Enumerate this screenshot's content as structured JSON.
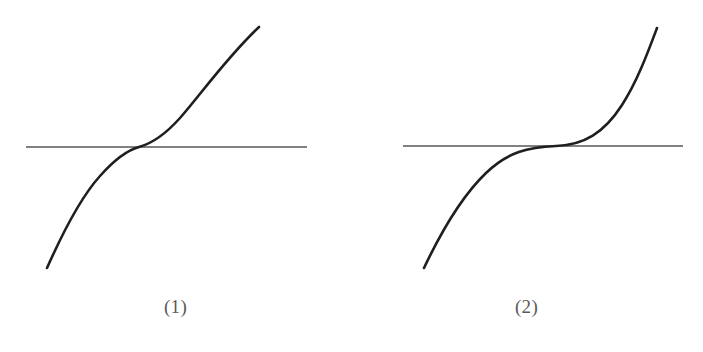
{
  "figure": {
    "background_color": "#ffffff",
    "curve_color": "#1f1f1f",
    "axis_line_color": "#575757",
    "caption_color": "#5a5a5a",
    "panels": [
      {
        "caption": "(1)",
        "curve_name": "cubic-increasing-curve",
        "axis_name": "horizontal-axis-line",
        "curve_path": "M 47 268 C 63 232 80 198 100 176 C 116 158 128 150 139 147 C 150 144 163 137 180 118 C 201 94 228 56 259 27",
        "axis_path": "M 26 147 L 307 147",
        "crossing_x": 139,
        "crossing_y": 147,
        "axis_y": 147,
        "axis_x_start": 26,
        "axis_x_end": 307,
        "curve_start": [
          47,
          268
        ],
        "curve_end": [
          259,
          27
        ]
      },
      {
        "caption": "(2)",
        "curve_name": "quintic-increasing-curve",
        "axis_name": "horizontal-axis-line",
        "curve_path": "M 424 268 C 442 230 462 196 486 173 C 508 152 528 147 556 146 C 584 145 604 133 622 105 C 637 82 648 52 657 28",
        "axis_path": "M 403 146 L 683 146",
        "crossing_x": 556,
        "crossing_y": 146,
        "axis_y": 146,
        "axis_x_start": 403,
        "axis_x_end": 683,
        "curve_start": [
          424,
          268
        ],
        "curve_end": [
          657,
          28
        ]
      }
    ]
  },
  "chart_data": {
    "type": "line",
    "title": "",
    "subtitle": "",
    "xlabel": "",
    "ylabel": "",
    "grid": false,
    "legend": "none",
    "annotations": [
      "(1)",
      "(2)"
    ],
    "panels": [
      {
        "label": "(1)",
        "shape": "cubic",
        "series": [
          {
            "name": "curve-1",
            "x": [
              -1.0,
              -0.85,
              -0.7,
              -0.55,
              -0.4,
              -0.25,
              -0.1,
              0.0,
              0.1,
              0.25,
              0.4,
              0.55,
              0.7,
              0.85,
              1.0
            ],
            "y": [
              -1.0,
              -0.614,
              -0.343,
              -0.166,
              -0.064,
              -0.016,
              -0.001,
              0.0,
              0.001,
              0.016,
              0.064,
              0.166,
              0.343,
              0.614,
              1.0
            ]
          },
          {
            "name": "horizontal-line-1",
            "x": [
              -1.15,
              1.15
            ],
            "y": [
              0,
              0
            ]
          }
        ],
        "intersections": [
          [
            0,
            0
          ]
        ],
        "xlim": [
          -1.2,
          1.2
        ],
        "ylim": [
          -1.2,
          1.2
        ]
      },
      {
        "label": "(2)",
        "shape": "quintic",
        "series": [
          {
            "name": "curve-2",
            "x": [
              -1.0,
              -0.85,
              -0.7,
              -0.55,
              -0.4,
              -0.25,
              -0.1,
              0.0,
              0.1,
              0.25,
              0.4,
              0.55,
              0.7,
              0.85,
              1.0
            ],
            "y": [
              -1.0,
              -0.444,
              -0.168,
              -0.05,
              -0.01,
              -0.001,
              0.0,
              0.0,
              0.0,
              0.001,
              0.01,
              0.05,
              0.168,
              0.444,
              1.0
            ]
          },
          {
            "name": "horizontal-line-2",
            "x": [
              -1.15,
              1.15
            ],
            "y": [
              0,
              0
            ]
          }
        ],
        "intersections": [
          [
            0,
            0
          ]
        ],
        "xlim": [
          -1.2,
          1.2
        ],
        "ylim": [
          -1.2,
          1.2
        ]
      }
    ]
  }
}
